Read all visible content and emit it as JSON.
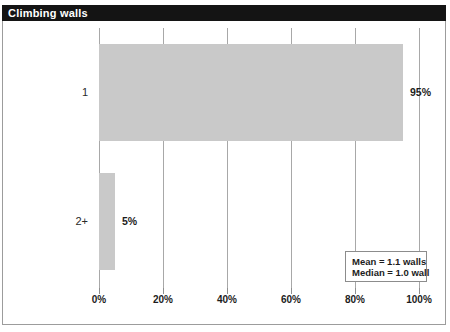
{
  "window": {
    "title": "Climbing walls"
  },
  "chart_data": {
    "type": "bar",
    "orientation": "horizontal",
    "title": "Climbing walls",
    "categories": [
      "1",
      "2+"
    ],
    "values": [
      95,
      5
    ],
    "value_labels": [
      "95%",
      "5%"
    ],
    "xlabel": "",
    "ylabel": "",
    "xlim": [
      0,
      100
    ],
    "x_ticks": [
      0,
      20,
      40,
      60,
      80,
      100
    ],
    "x_tick_labels": [
      "0%",
      "20%",
      "40%",
      "60%",
      "80%",
      "100%"
    ],
    "grid": "vertical-on",
    "legend_position": "bottom-right",
    "annotation": {
      "lines": [
        "Mean = 1.1 walls",
        "Median = 1.0 wall"
      ]
    },
    "colors": {
      "bar_fill": "#c9c9c9",
      "gridline": "#a8a8a8",
      "title_bar_bg": "#141414",
      "title_text": "#ffffff",
      "frame_border": "#9c9c9c"
    }
  }
}
